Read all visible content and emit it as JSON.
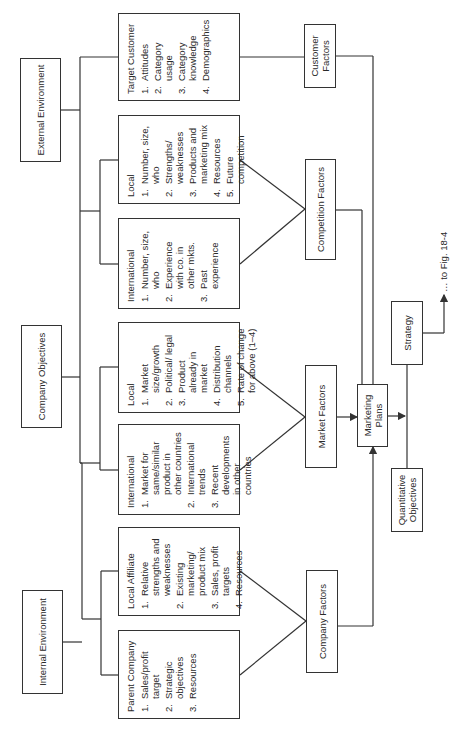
{
  "top_level": {
    "external": "External Environment",
    "objectives": "Company Objectives",
    "internal": "Internal Environment"
  },
  "details": {
    "target_customer": {
      "title": "Target Customer",
      "items": [
        "Attitudes",
        "Category usage",
        "Category knowledge",
        "Demographics"
      ]
    },
    "competition_local": {
      "title": "Local",
      "items": [
        "Number, size, who",
        "Strengths/ weaknesses",
        "Products and marketing mix",
        "Resources",
        "Future competition"
      ]
    },
    "competition_international": {
      "title": "International",
      "items": [
        "Number, size, who",
        "Experience with co. in other mkts.",
        "Past experience"
      ]
    },
    "market_local": {
      "title": "Local",
      "items": [
        "Market size/growth",
        "Political/ legal",
        "Product already in market",
        "Distribution channels",
        "Rate of change for above (1–4)"
      ]
    },
    "market_international": {
      "title": "International",
      "items": [
        "Market for same/similar product in other countries",
        "International trends",
        "Recent developments in other countries"
      ]
    },
    "local_affiliate": {
      "title": "Local Affiliate",
      "items": [
        "Relative strengths and weaknesses",
        "Existing marketing/ product mix",
        "Sales, profit targets",
        "Resources"
      ]
    },
    "parent_company": {
      "title": "Parent Company",
      "items": [
        "Sales/profit target",
        "Strategic objectives",
        "Resources"
      ]
    }
  },
  "factors": {
    "customer": "Customer Factors",
    "competition": "Competition Factors",
    "market": "Market Factors",
    "company": "Company Factors"
  },
  "outputs": {
    "marketing_plans": "Marketing Plans",
    "strategy": "Strategy",
    "quantitative": "Quantitative Objectives",
    "continuation": "… to Fig. 18-4"
  },
  "numbers": [
    "1.",
    "2.",
    "3.",
    "4.",
    "5."
  ],
  "colors": {
    "line": "#333333",
    "text": "#2a2a2a",
    "background": "#ffffff"
  }
}
